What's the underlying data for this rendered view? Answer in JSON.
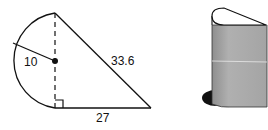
{
  "figure": {
    "left_diagram": {
      "description": "Semicircle attached to right triangle",
      "radius_label": "10",
      "hypotenuse_label": "33.6",
      "base_label": "27",
      "right_angle_marker": true
    },
    "right_diagram": {
      "description": "3D prism with semicircle-plus-triangle base"
    },
    "colors": {
      "line": "#111111",
      "prism_fill": "#a8a8a8",
      "shadow": "#111111"
    }
  }
}
